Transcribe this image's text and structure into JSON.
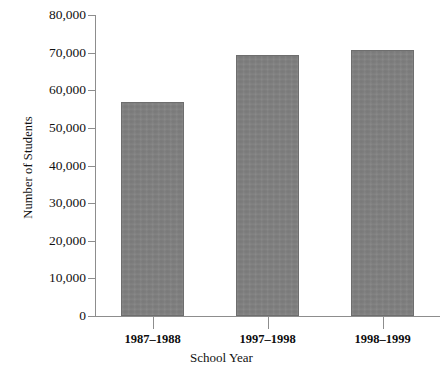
{
  "chart_data": {
    "type": "bar",
    "title": "",
    "subtitle": "",
    "xlabel": "School Year",
    "ylabel": "Number of Students",
    "categories": [
      "1987–1988",
      "1997–1998",
      "1998–1999"
    ],
    "values": [
      57000,
      69400,
      70800
    ],
    "ylim": [
      0,
      80000
    ],
    "yticks": [
      0,
      10000,
      20000,
      30000,
      40000,
      50000,
      60000,
      70000,
      80000
    ],
    "ytick_labels": [
      "0",
      "10,000",
      "20,000",
      "30,000",
      "40,000",
      "50,000",
      "60,000",
      "70,000",
      "80,000"
    ],
    "grid": false,
    "legend": null,
    "bar_color": "#808080",
    "bar_edge_color": "#6e6e6e",
    "axis_color": "#8d8d8d",
    "text_color": "#111111",
    "background": "#ffffff",
    "series": [
      {
        "name": "Number of Students",
        "values": [
          57000,
          69400,
          70800
        ]
      }
    ]
  }
}
